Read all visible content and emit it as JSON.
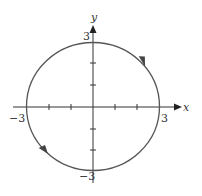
{
  "diagram": {
    "type": "parametric-circle",
    "radius": 3,
    "center": [
      0,
      0
    ],
    "x_axis": {
      "label": "x",
      "min_label": "−3",
      "max_label": "3",
      "tick_values": [
        -3,
        -2,
        -1,
        1,
        2,
        3
      ]
    },
    "y_axis": {
      "label": "y",
      "min_label": "−3",
      "max_label": "3",
      "tick_values": [
        -3,
        -2,
        -1,
        1,
        2,
        3
      ]
    },
    "direction_arrows": [
      {
        "position": "upper-right",
        "direction": "down-right"
      },
      {
        "position": "lower-left",
        "direction": "down-right"
      }
    ],
    "colors": {
      "circle": "#555555",
      "axes": "#333333",
      "arrow": "#444444"
    }
  }
}
